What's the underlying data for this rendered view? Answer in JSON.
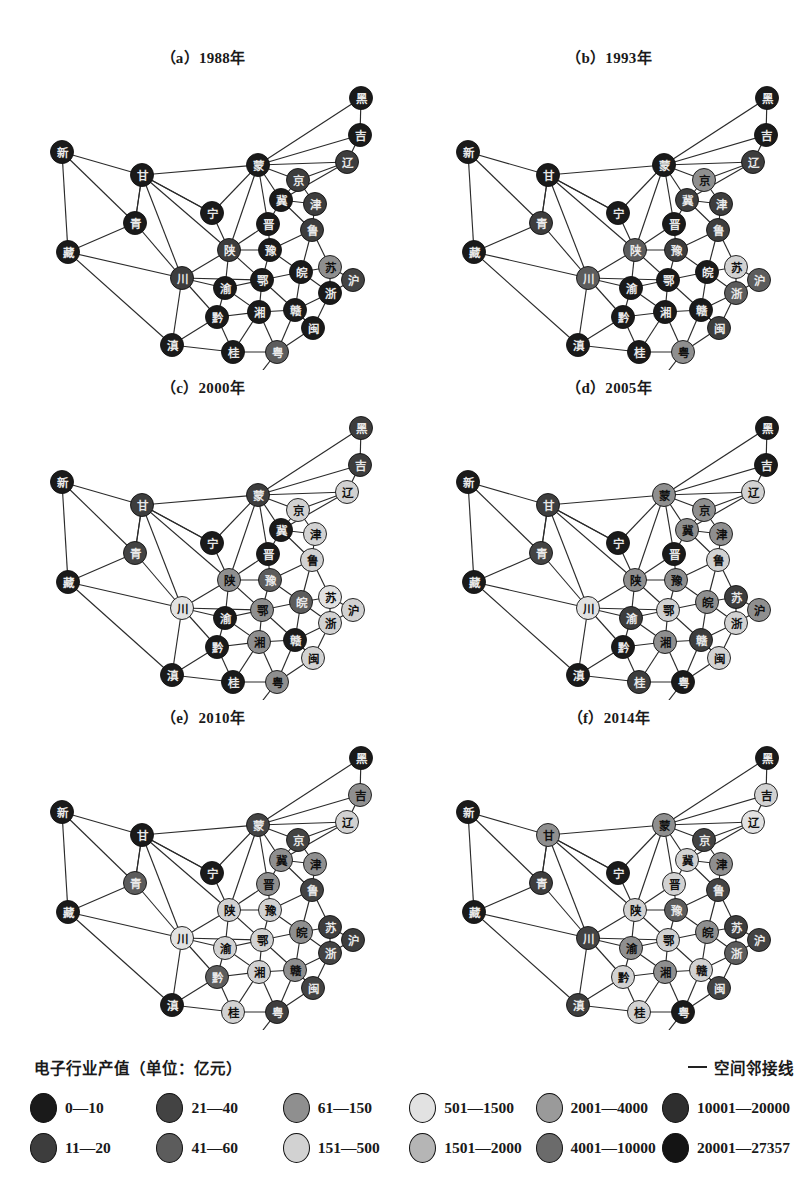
{
  "figure": {
    "panels": [
      {
        "id": "a",
        "title": "（a）1988年",
        "year": "1988"
      },
      {
        "id": "b",
        "title": "（b）1993年",
        "year": "1993"
      },
      {
        "id": "c",
        "title": "（c）2000年",
        "year": "2000"
      },
      {
        "id": "d",
        "title": "（d）2005年",
        "year": "2005"
      },
      {
        "id": "e",
        "title": "（e）2010年",
        "year": "2010"
      },
      {
        "id": "f",
        "title": "（f）2014年",
        "year": "2014"
      }
    ]
  },
  "legend": {
    "title": "电子行业产值（单位：亿元）",
    "line_label": "空间邻接线",
    "classes": [
      {
        "index": 1,
        "label": "0—10",
        "color": "#1a1a1a"
      },
      {
        "index": 2,
        "label": "11—20",
        "color": "#3d3d3d"
      },
      {
        "index": 3,
        "label": "21—40",
        "color": "#434343"
      },
      {
        "index": 4,
        "label": "41—60",
        "color": "#5c5c5c"
      },
      {
        "index": 5,
        "label": "61—150",
        "color": "#8f8f8f"
      },
      {
        "index": 6,
        "label": "151—500",
        "color": "#d2d2d2"
      },
      {
        "index": 7,
        "label": "501—1500",
        "color": "#e2e2e2"
      },
      {
        "index": 8,
        "label": "1501—2000",
        "color": "#b5b5b5"
      },
      {
        "index": 9,
        "label": "2001—4000",
        "color": "#9a9a9a"
      },
      {
        "index": 10,
        "label": "4001—10000",
        "color": "#6b6b6b"
      },
      {
        "index": 11,
        "label": "10001—20000",
        "color": "#2e2e2e"
      },
      {
        "index": 12,
        "label": "20001—27357",
        "color": "#141414"
      }
    ],
    "order": [
      [
        1,
        3,
        5,
        7,
        9,
        11
      ],
      [
        2,
        4,
        6,
        8,
        10,
        12
      ]
    ]
  },
  "network": {
    "nodes": [
      {
        "id": "hei",
        "label": "黑",
        "x": 361,
        "y": 58
      },
      {
        "id": "ji",
        "label": "吉",
        "x": 360,
        "y": 95
      },
      {
        "id": "liao",
        "label": "辽",
        "x": 347,
        "y": 122
      },
      {
        "id": "meng",
        "label": "蒙",
        "x": 258,
        "y": 125
      },
      {
        "id": "jing",
        "label": "京",
        "x": 298,
        "y": 140
      },
      {
        "id": "jin2",
        "label": "津",
        "x": 315,
        "y": 164
      },
      {
        "id": "jiCity",
        "label": "冀",
        "x": 281,
        "y": 160
      },
      {
        "id": "lu",
        "label": "鲁",
        "x": 312,
        "y": 190
      },
      {
        "id": "jinShanxi",
        "label": "晋",
        "x": 268,
        "y": 184
      },
      {
        "id": "xin",
        "label": "新",
        "x": 62,
        "y": 112
      },
      {
        "id": "gan",
        "label": "甘",
        "x": 142,
        "y": 135
      },
      {
        "id": "ning",
        "label": "宁",
        "x": 212,
        "y": 173
      },
      {
        "id": "qing",
        "label": "青",
        "x": 135,
        "y": 183
      },
      {
        "id": "zang",
        "label": "藏",
        "x": 68,
        "y": 212
      },
      {
        "id": "shan",
        "label": "陕",
        "x": 229,
        "y": 210
      },
      {
        "id": "yu",
        "label": "豫",
        "x": 270,
        "y": 210
      },
      {
        "id": "chuan",
        "label": "川",
        "x": 182,
        "y": 238
      },
      {
        "id": "wan",
        "label": "皖",
        "x": 301,
        "y": 232
      },
      {
        "id": "su",
        "label": "苏",
        "x": 330,
        "y": 227
      },
      {
        "id": "hu",
        "label": "沪",
        "x": 353,
        "y": 240
      },
      {
        "id": "e",
        "label": "鄂",
        "x": 262,
        "y": 240
      },
      {
        "id": "yuChongqing",
        "label": "渝",
        "x": 225,
        "y": 248
      },
      {
        "id": "zhe",
        "label": "浙",
        "x": 330,
        "y": 253
      },
      {
        "id": "xiang",
        "label": "湘",
        "x": 259,
        "y": 272
      },
      {
        "id": "gan2",
        "label": "赣",
        "x": 295,
        "y": 270
      },
      {
        "id": "min",
        "label": "闽",
        "x": 313,
        "y": 288
      },
      {
        "id": "qian",
        "label": "黔",
        "x": 217,
        "y": 277
      },
      {
        "id": "dian",
        "label": "滇",
        "x": 172,
        "y": 305
      },
      {
        "id": "gui",
        "label": "桂",
        "x": 233,
        "y": 312
      },
      {
        "id": "yue",
        "label": "粤",
        "x": 277,
        "y": 312
      },
      {
        "id": "qiong",
        "label": "琼",
        "x": 243,
        "y": 356
      }
    ],
    "edges": [
      [
        "hei",
        "ji"
      ],
      [
        "hei",
        "meng"
      ],
      [
        "ji",
        "liao"
      ],
      [
        "ji",
        "meng"
      ],
      [
        "liao",
        "meng"
      ],
      [
        "liao",
        "jing"
      ],
      [
        "liao",
        "jiCity"
      ],
      [
        "meng",
        "jing"
      ],
      [
        "meng",
        "jiCity"
      ],
      [
        "meng",
        "jinShanxi"
      ],
      [
        "meng",
        "shan"
      ],
      [
        "meng",
        "ning"
      ],
      [
        "meng",
        "gan"
      ],
      [
        "jing",
        "jiCity"
      ],
      [
        "jing",
        "jin2"
      ],
      [
        "jin2",
        "jiCity"
      ],
      [
        "jin2",
        "lu"
      ],
      [
        "jiCity",
        "jinShanxi"
      ],
      [
        "jiCity",
        "lu"
      ],
      [
        "lu",
        "yu"
      ],
      [
        "lu",
        "wan"
      ],
      [
        "lu",
        "su"
      ],
      [
        "jinShanxi",
        "shan"
      ],
      [
        "jinShanxi",
        "yu"
      ],
      [
        "xin",
        "gan"
      ],
      [
        "xin",
        "qing"
      ],
      [
        "xin",
        "zang"
      ],
      [
        "gan",
        "qing"
      ],
      [
        "gan",
        "ning"
      ],
      [
        "gan",
        "shan"
      ],
      [
        "gan",
        "chuan"
      ],
      [
        "qing",
        "zang"
      ],
      [
        "qing",
        "chuan"
      ],
      [
        "qing",
        "gan"
      ],
      [
        "zang",
        "chuan"
      ],
      [
        "zang",
        "dian"
      ],
      [
        "ning",
        "shan"
      ],
      [
        "ning",
        "gan"
      ],
      [
        "shan",
        "yu"
      ],
      [
        "shan",
        "e"
      ],
      [
        "shan",
        "chuan"
      ],
      [
        "shan",
        "yuChongqing"
      ],
      [
        "yu",
        "e"
      ],
      [
        "yu",
        "wan"
      ],
      [
        "chuan",
        "yuChongqing"
      ],
      [
        "chuan",
        "qian"
      ],
      [
        "chuan",
        "dian"
      ],
      [
        "chuan",
        "e"
      ],
      [
        "wan",
        "su"
      ],
      [
        "wan",
        "zhe"
      ],
      [
        "wan",
        "gan2"
      ],
      [
        "wan",
        "e"
      ],
      [
        "su",
        "hu"
      ],
      [
        "su",
        "zhe"
      ],
      [
        "hu",
        "zhe"
      ],
      [
        "e",
        "yuChongqing"
      ],
      [
        "e",
        "xiang"
      ],
      [
        "e",
        "gan2"
      ],
      [
        "yuChongqing",
        "qian"
      ],
      [
        "yuChongqing",
        "xiang"
      ],
      [
        "zhe",
        "gan2"
      ],
      [
        "zhe",
        "min"
      ],
      [
        "xiang",
        "gan2"
      ],
      [
        "xiang",
        "qian"
      ],
      [
        "xiang",
        "gui"
      ],
      [
        "xiang",
        "yue"
      ],
      [
        "gan2",
        "min"
      ],
      [
        "gan2",
        "yue"
      ],
      [
        "min",
        "yue"
      ],
      [
        "qian",
        "gui"
      ],
      [
        "qian",
        "dian"
      ],
      [
        "dian",
        "gui"
      ],
      [
        "gui",
        "yue"
      ],
      [
        "yue",
        "qiong"
      ]
    ]
  },
  "panel_values": {
    "a": {
      "hei": 1,
      "ji": 1,
      "liao": 2,
      "meng": 1,
      "jing": 2,
      "jin2": 2,
      "jiCity": 1,
      "lu": 2,
      "jinShanxi": 1,
      "xin": 1,
      "gan": 1,
      "ning": 1,
      "qing": 1,
      "zang": 1,
      "shan": 2,
      "yu": 1,
      "chuan": 2,
      "wan": 1,
      "su": 5,
      "hu": 3,
      "e": 1,
      "yuChongqing": 1,
      "zhe": 1,
      "xiang": 1,
      "gan2": 1,
      "min": 1,
      "qian": 1,
      "dian": 1,
      "gui": 1,
      "yue": 4,
      "qiong": 1
    },
    "b": {
      "hei": 1,
      "ji": 1,
      "liao": 2,
      "meng": 1,
      "jing": 5,
      "jin2": 2,
      "jiCity": 2,
      "lu": 2,
      "jinShanxi": 1,
      "xin": 1,
      "gan": 1,
      "ning": 1,
      "qing": 2,
      "zang": 1,
      "shan": 4,
      "yu": 2,
      "chuan": 4,
      "wan": 1,
      "su": 6,
      "hu": 4,
      "e": 1,
      "yuChongqing": 1,
      "zhe": 4,
      "xiang": 1,
      "gan2": 1,
      "min": 2,
      "qian": 1,
      "dian": 1,
      "gui": 1,
      "yue": 5,
      "qiong": 1
    },
    "c": {
      "hei": 2,
      "ji": 2,
      "liao": 6,
      "meng": 2,
      "jing": 6,
      "jin2": 6,
      "jiCity": 1,
      "lu": 6,
      "jinShanxi": 1,
      "xin": 1,
      "gan": 2,
      "ning": 1,
      "qing": 3,
      "zang": 1,
      "shan": 5,
      "yu": 4,
      "chuan": 7,
      "wan": 4,
      "su": 7,
      "hu": 6,
      "e": 5,
      "yuChongqing": 1,
      "zhe": 6,
      "xiang": 5,
      "gan2": 1,
      "min": 6,
      "qian": 1,
      "dian": 1,
      "gui": 1,
      "yue": 5,
      "qiong": 1
    },
    "d": {
      "hei": 1,
      "ji": 1,
      "liao": 6,
      "meng": 5,
      "jing": 5,
      "jin2": 5,
      "jiCity": 5,
      "lu": 6,
      "jinShanxi": 1,
      "xin": 1,
      "gan": 2,
      "ning": 1,
      "qing": 3,
      "zang": 1,
      "shan": 5,
      "yu": 5,
      "chuan": 7,
      "wan": 5,
      "su": 2,
      "hu": 5,
      "e": 6,
      "yuChongqing": 2,
      "zhe": 6,
      "xiang": 5,
      "gan2": 2,
      "min": 6,
      "qian": 1,
      "dian": 1,
      "gui": 2,
      "yue": 1,
      "qiong": 1
    },
    "e": {
      "hei": 1,
      "ji": 5,
      "liao": 6,
      "meng": 3,
      "jing": 3,
      "jin2": 5,
      "jiCity": 5,
      "lu": 3,
      "jinShanxi": 5,
      "xin": 1,
      "gan": 1,
      "ning": 1,
      "qing": 4,
      "zang": 1,
      "shan": 6,
      "yu": 6,
      "chuan": 7,
      "wan": 5,
      "su": 2,
      "hu": 2,
      "e": 6,
      "yuChongqing": 6,
      "zhe": 3,
      "xiang": 6,
      "gan2": 5,
      "min": 3,
      "qian": 4,
      "dian": 1,
      "gui": 6,
      "yue": 2,
      "qiong": 1
    },
    "f": {
      "hei": 1,
      "ji": 6,
      "liao": 7,
      "meng": 5,
      "jing": 3,
      "jin2": 5,
      "jiCity": 6,
      "lu": 3,
      "jinShanxi": 6,
      "xin": 1,
      "gan": 5,
      "ning": 1,
      "qing": 2,
      "zang": 1,
      "shan": 6,
      "yu": 4,
      "chuan": 3,
      "wan": 5,
      "su": 2,
      "hu": 3,
      "e": 6,
      "yuChongqing": 5,
      "zhe": 4,
      "xiang": 5,
      "gan2": 6,
      "min": 3,
      "qian": 6,
      "dian": 2,
      "gui": 6,
      "yue": 1,
      "qiong": 1
    }
  }
}
